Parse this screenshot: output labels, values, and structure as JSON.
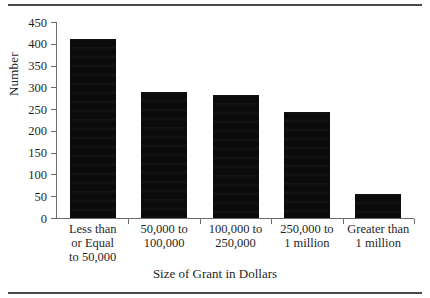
{
  "figure": {
    "top_rule": true,
    "bottom_rule": true,
    "background_color": "#ffffff",
    "bar_color": "#0b0b0b",
    "axis_color": "#6b6b6b",
    "text_color": "#1f1f1f"
  },
  "chart_data": {
    "type": "bar",
    "title": "",
    "xlabel": "Size of Grant in Dollars",
    "ylabel": "Number",
    "categories": [
      "Less than or Equal to 50,000",
      "50,000 to 100,000",
      "100,000 to 250,000",
      "250,000 to 1 million",
      "Greater than 1 million"
    ],
    "category_lines": [
      [
        "Less than",
        "or Equal",
        "to 50,000"
      ],
      [
        "50,000 to",
        "100,000"
      ],
      [
        "100,000 to",
        "250,000"
      ],
      [
        "250,000 to",
        "1 million"
      ],
      [
        "Greater than",
        "1 million"
      ]
    ],
    "values": [
      410,
      290,
      282,
      243,
      55
    ],
    "ylim": [
      0,
      450
    ],
    "ytick_labels": [
      "450",
      "400",
      "350",
      "300",
      "250",
      "200",
      "150",
      "100",
      "50",
      "0"
    ],
    "ytick_values": [
      450,
      400,
      350,
      300,
      250,
      200,
      150,
      100,
      50,
      0
    ],
    "grid": false,
    "legend": false
  }
}
